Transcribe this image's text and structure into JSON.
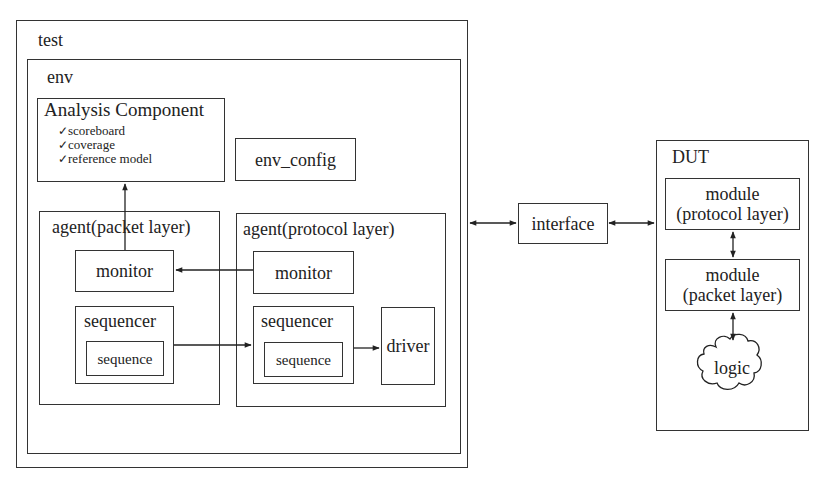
{
  "diagram": {
    "test": {
      "label": "test"
    },
    "env": {
      "label": "env"
    },
    "analysis": {
      "title": "Analysis Component",
      "items": [
        {
          "icon": "checkmark-icon",
          "glyph": "✓",
          "label": "scoreboard"
        },
        {
          "icon": "checkmark-icon",
          "glyph": "✓",
          "label": "coverage"
        },
        {
          "icon": "checkmark-icon",
          "glyph": "✓",
          "label": "reference model"
        }
      ]
    },
    "env_config": {
      "label": "env_config"
    },
    "agent_packet": {
      "title": "agent(packet layer)",
      "monitor": "monitor",
      "sequencer": "sequencer",
      "sequence": "sequence"
    },
    "agent_protocol": {
      "title": "agent(protocol layer)",
      "monitor": "monitor",
      "sequencer": "sequencer",
      "sequence": "sequence",
      "driver": "driver"
    },
    "interface": {
      "label": "interface"
    },
    "dut": {
      "title": "DUT",
      "module_protocol": {
        "line1": "module",
        "line2": "(protocol layer)"
      },
      "module_packet": {
        "line1": "module",
        "line2": "(packet layer)"
      },
      "logic": {
        "label": "logic"
      }
    },
    "connections": [
      {
        "from": "agent_packet.monitor",
        "to": "analysis",
        "type": "arrow"
      },
      {
        "from": "agent_protocol.monitor",
        "to": "agent_packet.monitor",
        "type": "arrow"
      },
      {
        "from": "agent_packet.sequencer",
        "to": "agent_protocol.sequencer",
        "type": "arrow"
      },
      {
        "from": "agent_protocol.sequencer",
        "to": "agent_protocol.driver",
        "type": "arrow"
      },
      {
        "from": "env",
        "to": "interface",
        "type": "bidirectional"
      },
      {
        "from": "interface",
        "to": "dut",
        "type": "bidirectional"
      },
      {
        "from": "dut.module_protocol",
        "to": "dut.module_packet",
        "type": "bidirectional"
      },
      {
        "from": "dut.module_packet",
        "to": "dut.logic",
        "type": "bidirectional"
      }
    ]
  }
}
